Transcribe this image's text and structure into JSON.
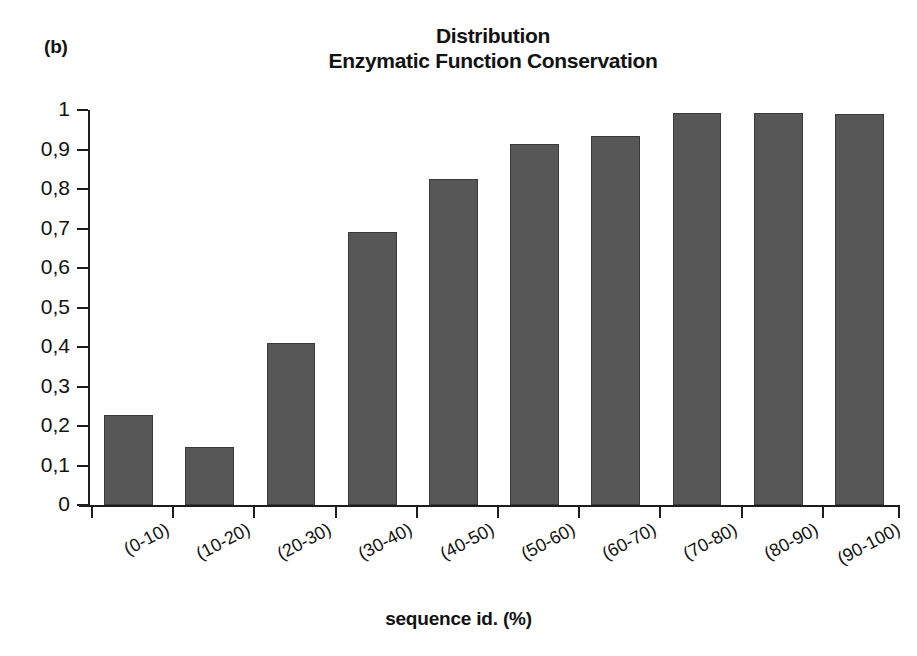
{
  "panel_label": "(b)",
  "title": {
    "line1": "Distribution",
    "line2": "Enzymatic Function Conservation"
  },
  "axis": {
    "x_title": "sequence id. (%)",
    "y_title": "",
    "y_ticks": [
      "0",
      "0,1",
      "0,2",
      "0,3",
      "0,4",
      "0,5",
      "0,6",
      "0,7",
      "0,8",
      "0,9",
      "1"
    ]
  },
  "colors": {
    "bar_fill": "#575757",
    "bar_edge": "#3a3a3a",
    "axis": "#1d1d1d",
    "background": "#ffffff",
    "text": "#121212"
  },
  "chart_data": {
    "type": "bar",
    "title": "Distribution Enzymatic Function Conservation",
    "subtitle": "",
    "xlabel": "sequence id. (%)",
    "ylabel": "",
    "categories": [
      "(0-10)",
      "(10-20)",
      "(20-30)",
      "(30-40)",
      "(40-50)",
      "(50-60)",
      "(60-70)",
      "(70-80)",
      "(80-90)",
      "(90-100)"
    ],
    "values": [
      0.228,
      0.147,
      0.411,
      0.692,
      0.826,
      0.913,
      0.933,
      0.993,
      0.992,
      0.991
    ],
    "ylim": [
      0,
      1
    ],
    "ytick_values": [
      0,
      0.1,
      0.2,
      0.3,
      0.4,
      0.5,
      0.6,
      0.7,
      0.8,
      0.9,
      1
    ],
    "ytick_labels": [
      "0",
      "0,1",
      "0,2",
      "0,3",
      "0,4",
      "0,5",
      "0,6",
      "0,7",
      "0,8",
      "0,9",
      "1"
    ],
    "grid": false,
    "legend": false,
    "legend_position": "none",
    "bar_color": "#575757",
    "decimal_separator": ","
  }
}
